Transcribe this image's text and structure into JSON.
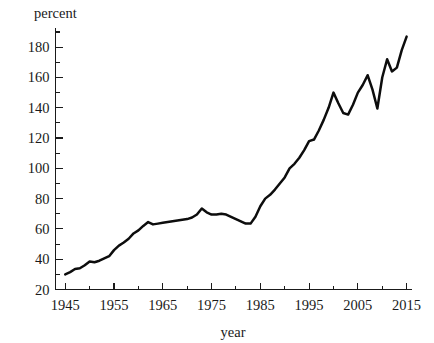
{
  "chart_data": {
    "type": "line",
    "title": "",
    "subtitle": "",
    "xlabel": "year",
    "ylabel": "percent",
    "grid": false,
    "legend": "none",
    "legend_position": "none",
    "line_color": "#0d0d0d",
    "axis_color": "#1a1a1a",
    "background_color": "#ffffff",
    "xlim": [
      1943,
      2016
    ],
    "ylim": [
      20,
      192
    ],
    "x_major_ticks": [
      1945,
      1955,
      1965,
      1975,
      1985,
      1995,
      2005,
      2015
    ],
    "x_major_tick_labels": [
      "1945",
      "1955",
      "1965",
      "1975",
      "1985",
      "1995",
      "2005",
      "2015"
    ],
    "x_minor_ticks": [
      1950,
      1960,
      1970,
      1980,
      1990,
      2000,
      2010
    ],
    "y_major_ticks": [
      20,
      40,
      60,
      80,
      100,
      120,
      140,
      160,
      180
    ],
    "y_major_tick_labels": [
      "20",
      "40",
      "60",
      "80",
      "100",
      "120",
      "140",
      "160",
      "180"
    ],
    "y_minor_ticks": [
      30,
      50,
      70,
      90,
      110,
      130,
      150,
      170,
      190
    ],
    "series": [
      {
        "name": "percent",
        "x": [
          1945,
          1946,
          1947,
          1948,
          1949,
          1950,
          1951,
          1952,
          1953,
          1954,
          1955,
          1956,
          1957,
          1958,
          1959,
          1960,
          1961,
          1962,
          1963,
          1964,
          1965,
          1966,
          1967,
          1968,
          1969,
          1970,
          1971,
          1972,
          1973,
          1974,
          1975,
          1976,
          1977,
          1978,
          1979,
          1980,
          1981,
          1982,
          1983,
          1984,
          1985,
          1986,
          1987,
          1988,
          1989,
          1990,
          1991,
          1992,
          1993,
          1994,
          1995,
          1996,
          1997,
          1998,
          1999,
          2000,
          2001,
          2002,
          2003,
          2004,
          2005,
          2006,
          2007,
          2008,
          2009,
          2010,
          2011,
          2012,
          2013,
          2014,
          2015
        ],
        "y": [
          30.0,
          31.5,
          33.5,
          34.0,
          36.0,
          38.5,
          38.0,
          39.0,
          40.5,
          42.0,
          46.0,
          49.0,
          51.0,
          53.5,
          57.0,
          59.0,
          62.0,
          64.5,
          63.0,
          63.5,
          64.0,
          64.5,
          65.0,
          65.5,
          66.0,
          66.5,
          67.5,
          69.5,
          73.5,
          71.0,
          69.5,
          69.5,
          70.0,
          69.5,
          68.0,
          66.5,
          65.0,
          63.5,
          63.5,
          68.0,
          75.0,
          80.0,
          82.5,
          86.0,
          90.0,
          94.0,
          100.0,
          103.0,
          107.0,
          112.0,
          118.0,
          119.0,
          125.0,
          132.0,
          140.0,
          150.0,
          143.0,
          136.5,
          135.5,
          142.0,
          150.0,
          155.0,
          161.5,
          152.0,
          139.5,
          160.0,
          172.0,
          164.0,
          166.5,
          178.0,
          187.0
        ]
      }
    ]
  },
  "axes": {
    "y_caption": "percent",
    "x_caption": "year"
  }
}
